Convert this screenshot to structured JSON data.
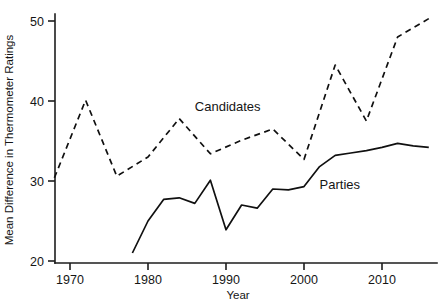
{
  "chart_data": {
    "type": "line",
    "title": "",
    "subtitle": "",
    "xlabel": "Year",
    "ylabel": "Mean Difference in Thermometer Ratings",
    "xlim": [
      1966,
      2017
    ],
    "ylim": [
      19,
      51.5
    ],
    "xticks": [
      1970,
      1980,
      1990,
      2000,
      2010
    ],
    "xtick_labels": [
      "1970",
      "1980",
      "1990",
      "2000",
      "2010"
    ],
    "yticks": [
      20,
      30,
      40,
      50
    ],
    "ytick_labels": [
      "20",
      "30",
      "40",
      "50"
    ],
    "grid": false,
    "legend_position": "inline-annotation",
    "series": [
      {
        "name": "Candidates",
        "style": "dashed",
        "label_x": 1986,
        "label_y": 38.8,
        "x": [
          1968,
          1972,
          1976,
          1980,
          1984,
          1988,
          1992,
          1996,
          2000,
          2004,
          2008,
          2012,
          2016
        ],
        "values": [
          30.4,
          40.1,
          30.6,
          33.0,
          37.8,
          33.4,
          35.1,
          36.5,
          32.7,
          44.5,
          37.5,
          48.0,
          50.3
        ]
      },
      {
        "name": "Parties",
        "style": "solid",
        "label_x": 2002,
        "label_y": 29.0,
        "x": [
          1978,
          1980,
          1982,
          1984,
          1986,
          1988,
          1990,
          1992,
          1994,
          1996,
          1998,
          2000,
          2002,
          2004,
          2006,
          2008,
          2010,
          2012,
          2014,
          2016
        ],
        "values": [
          21.0,
          25.0,
          27.7,
          27.9,
          27.2,
          30.1,
          23.9,
          27.0,
          26.6,
          29.0,
          28.9,
          29.3,
          31.8,
          33.2,
          33.5,
          33.8,
          34.2,
          34.7,
          34.4,
          34.2
        ]
      }
    ]
  },
  "axes": {
    "ylabel": "Mean Difference in Thermometer Ratings",
    "xlabel": "Year"
  },
  "ticks": {
    "y": [
      "50",
      "40",
      "30",
      "20"
    ],
    "x": [
      "1970",
      "1980",
      "1990",
      "2000",
      "2010"
    ]
  },
  "annotations": {
    "candidates": "Candidates",
    "parties": "Parties"
  },
  "colors": {
    "line": "#101010",
    "axis": "#1d1d1d",
    "background": "#ffffff"
  }
}
